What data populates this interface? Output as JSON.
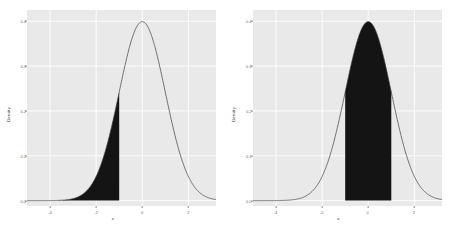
{
  "figure": {
    "background": "#ffffff",
    "panel_background": "#e9e9e9",
    "gridline_color": "#ffffff",
    "curve_color": "#3a3a3a",
    "shade_color": "#141414",
    "tick_label_color": "#6b6b6b",
    "axis_title_color": "#2b2b2b"
  },
  "chart_data": [
    {
      "type": "area",
      "title": "",
      "subtitle": "",
      "xlabel": "x",
      "ylabel": "Density",
      "xlim": [
        -5,
        3.2
      ],
      "ylim": [
        -0.012,
        0.425
      ],
      "xticks": [
        -4,
        -2,
        0,
        2
      ],
      "xticklabels": [
        "-4",
        "-2",
        "0",
        "2"
      ],
      "yticks": [
        0.0,
        0.1,
        0.2,
        0.3,
        0.4
      ],
      "yticklabels": [
        "0.0",
        "0.1",
        "0.2",
        "0.3",
        "0.4"
      ],
      "grid": true,
      "legend": "none",
      "distribution": "normal",
      "mean": 0,
      "sd": 1,
      "shaded_region": {
        "type": "lower-tail",
        "from": -5,
        "to": -1,
        "area": 0.1587,
        "fill": "#141414"
      },
      "series": [
        {
          "name": "standard normal density",
          "x": [
            -5,
            -4.5,
            -4,
            -3.5,
            -3,
            -2.5,
            -2,
            -1.5,
            -1,
            -0.5,
            0,
            0.5,
            1,
            1.5,
            2,
            2.5,
            3,
            3.2
          ],
          "values": [
            1.5e-06,
            1.6e-05,
            0.0001338,
            0.0008727,
            0.0044318,
            0.0175283,
            0.053991,
            0.1295176,
            0.2419707,
            0.3520653,
            0.3989423,
            0.3520653,
            0.2419707,
            0.1295176,
            0.053991,
            0.0175283,
            0.0044318,
            0.0023841
          ]
        }
      ]
    },
    {
      "type": "area",
      "title": "",
      "subtitle": "",
      "xlabel": "x",
      "ylabel": "Density",
      "xlim": [
        -5,
        3.2
      ],
      "ylim": [
        -0.012,
        0.425
      ],
      "xticks": [
        -4,
        -2,
        0,
        2
      ],
      "xticklabels": [
        "-4",
        "-2",
        "0",
        "2"
      ],
      "yticks": [
        0.0,
        0.1,
        0.2,
        0.3,
        0.4
      ],
      "yticklabels": [
        "0.0",
        "0.1",
        "0.2",
        "0.3",
        "0.4"
      ],
      "grid": true,
      "legend": "none",
      "distribution": "normal",
      "mean": 0,
      "sd": 1,
      "shaded_region": {
        "type": "central",
        "from": -1,
        "to": 1,
        "area": 0.6827,
        "fill": "#141414"
      },
      "series": [
        {
          "name": "standard normal density",
          "x": [
            -5,
            -4.5,
            -4,
            -3.5,
            -3,
            -2.5,
            -2,
            -1.5,
            -1,
            -0.5,
            0,
            0.5,
            1,
            1.5,
            2,
            2.5,
            3,
            3.2
          ],
          "values": [
            1.5e-06,
            1.6e-05,
            0.0001338,
            0.0008727,
            0.0044318,
            0.0175283,
            0.053991,
            0.1295176,
            0.2419707,
            0.3520653,
            0.3989423,
            0.3520653,
            0.2419707,
            0.1295176,
            0.053991,
            0.0175283,
            0.0044318,
            0.0023841
          ]
        }
      ]
    }
  ]
}
